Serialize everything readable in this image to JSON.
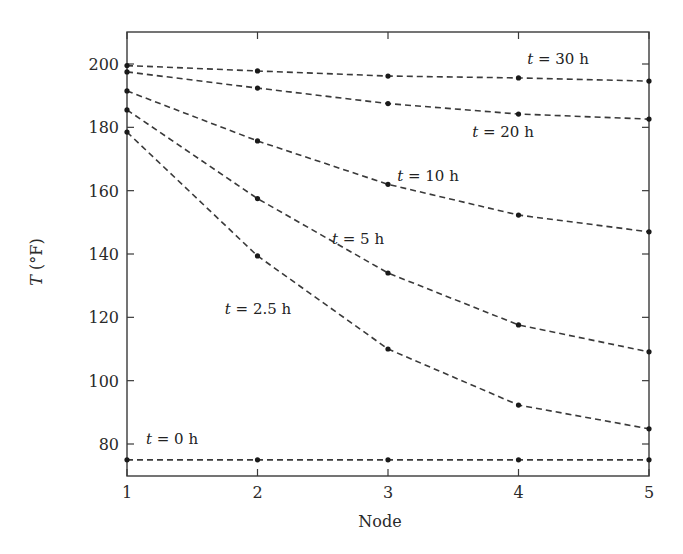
{
  "chart_data": {
    "type": "line",
    "title": "",
    "xlabel": "Node",
    "ylabel": "T (°F)",
    "ylabel_parts": {
      "var": "T",
      "unit": " (°F)"
    },
    "x": [
      1,
      2,
      3,
      4,
      5
    ],
    "xlim": [
      1,
      5
    ],
    "ylim": [
      70,
      210
    ],
    "xticks": [
      1,
      2,
      3,
      4,
      5
    ],
    "yticks": [
      80,
      100,
      120,
      140,
      160,
      180,
      200
    ],
    "grid": false,
    "legend": "inline labels",
    "line_style": "dashed",
    "marker": "dot",
    "series": [
      {
        "name": "t = 0 h",
        "time_h": "0",
        "values": [
          75.0,
          75.0,
          75.0,
          75.0,
          75.0
        ],
        "label": {
          "x": 172,
          "y": 444
        }
      },
      {
        "name": "t = 2.5 h",
        "time_h": "2.5",
        "values": [
          178.5,
          139.4,
          110.0,
          92.3,
          84.8
        ],
        "label": {
          "x": 258,
          "y": 314
        }
      },
      {
        "name": "t = 5 h",
        "time_h": "5",
        "values": [
          185.5,
          157.5,
          134.0,
          117.6,
          109.1
        ],
        "label": {
          "x": 358,
          "y": 244
        }
      },
      {
        "name": "t = 10 h",
        "time_h": "10",
        "values": [
          191.5,
          175.7,
          162.0,
          152.3,
          147.0
        ],
        "label": {
          "x": 428,
          "y": 181
        }
      },
      {
        "name": "t = 20 h",
        "time_h": "20",
        "values": [
          197.5,
          192.4,
          187.5,
          184.2,
          182.6
        ],
        "label": {
          "x": 503,
          "y": 137
        }
      },
      {
        "name": "t = 30 h",
        "time_h": "30",
        "values": [
          199.5,
          197.8,
          196.2,
          195.6,
          194.6
        ],
        "label": {
          "x": 558,
          "y": 64
        }
      }
    ]
  },
  "colors": {
    "line": "#3a3a3a",
    "marker": "#1a1a1a",
    "text": "#2a2a2a",
    "background": "#ffffff"
  }
}
